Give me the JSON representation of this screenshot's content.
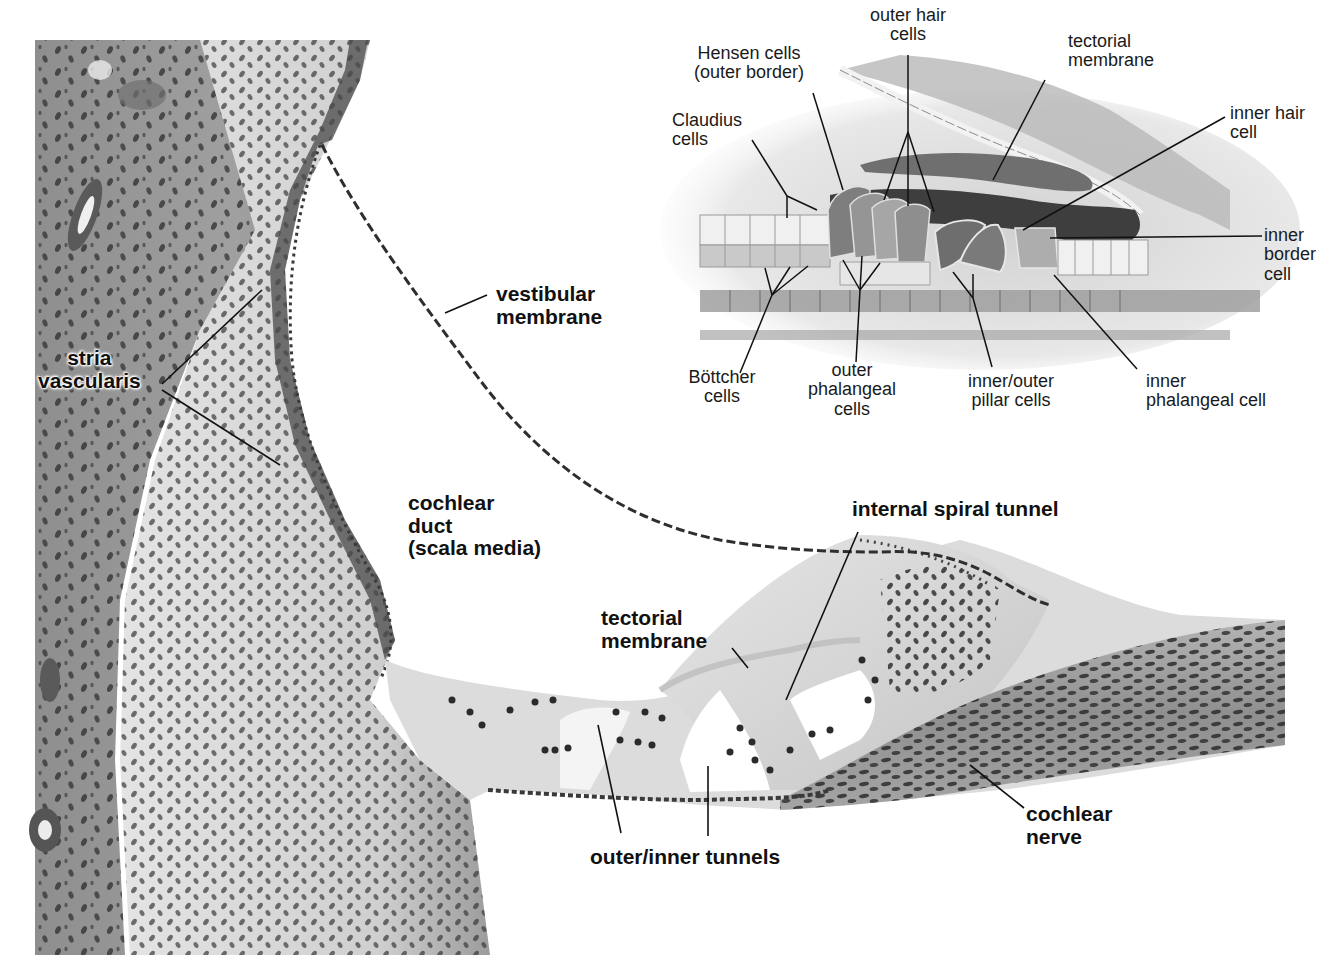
{
  "micrograph": {
    "labels": {
      "stria_vascularis": [
        "stria",
        "vascularis"
      ],
      "vestibular_membrane": [
        "vestibular",
        "membrane"
      ],
      "cochlear_duct": [
        "cochlear",
        "duct",
        "(scala media)"
      ],
      "internal_spiral_tunnel": [
        "internal spiral tunnel"
      ],
      "tectorial_membrane": [
        "tectorial",
        "membrane"
      ],
      "outer_inner_tunnels": [
        "outer/inner tunnels"
      ],
      "cochlear_nerve": [
        "cochlear",
        "nerve"
      ]
    }
  },
  "inset": {
    "labels": {
      "outer_hair_cells": [
        "outer hair",
        "cells"
      ],
      "hensen_cells": [
        "Hensen cells",
        "(outer border)"
      ],
      "tectorial_membrane": [
        "tectorial",
        "membrane"
      ],
      "claudius_cells": [
        "Claudius",
        "cells"
      ],
      "inner_hair_cell": [
        "inner hair",
        "cell"
      ],
      "inner_border_cell": [
        "inner",
        "border",
        "cell"
      ],
      "bottcher_cells": [
        "Böttcher",
        "cells"
      ],
      "outer_phalangeal_cells": [
        "outer",
        "phalangeal",
        "cells"
      ],
      "pillar_cells": [
        "inner/outer",
        "pillar cells"
      ],
      "inner_phalangeal_cell": [
        "inner",
        "phalangeal cell"
      ]
    }
  },
  "colors": {
    "tissue_dark": "#6e6e6e",
    "tissue_mid": "#a6a6a6",
    "tissue_light": "#d8d8d8",
    "nucleus": "#2a2a2a",
    "background": "#ffffff"
  }
}
